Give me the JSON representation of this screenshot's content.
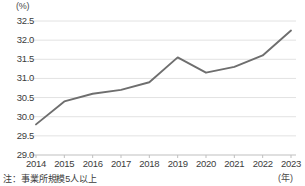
{
  "chart_data": {
    "type": "line",
    "title": "",
    "subtitle": "",
    "xlabel": "(年)",
    "ylabel": "(%)",
    "categories": [
      "2014",
      "2015",
      "2016",
      "2017",
      "2018",
      "2019",
      "2020",
      "2021",
      "2022",
      "2023"
    ],
    "series": [
      {
        "name": "",
        "values": [
          29.8,
          30.4,
          30.6,
          30.7,
          30.9,
          31.55,
          31.15,
          31.3,
          31.6,
          32.25
        ]
      }
    ],
    "ylim": [
      29.0,
      32.5
    ],
    "ytick_labels": [
      "32.5",
      "32.0",
      "31.5",
      "31.0",
      "30.5",
      "30.0",
      "29.5",
      "29.0"
    ],
    "ytick_values": [
      32.5,
      32.0,
      31.5,
      31.0,
      30.5,
      30.0,
      29.5,
      29.0
    ],
    "grid": true,
    "legend": "none",
    "line_color": "#6e6e6e",
    "grid_color": "#e2e2e2",
    "axis_color": "#bfbfbf"
  },
  "annotations": {
    "footnote": "注：事業所規模5人以上"
  }
}
